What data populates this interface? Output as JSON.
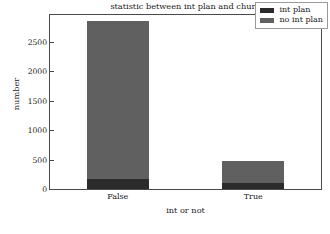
{
  "chart_data": {
    "type": "bar",
    "subtype": "stacked",
    "title": "statistic between int plan and churn",
    "xlabel": "int or not",
    "ylabel": "number",
    "categories": [
      "False",
      "True"
    ],
    "series": [
      {
        "name": "int plan",
        "color": "#2b2b2b",
        "values": [
          170,
          110
        ]
      },
      {
        "name": "no int plan",
        "color": "#606060",
        "values": [
          2680,
          373
        ]
      }
    ],
    "totals": [
      2850,
      483
    ],
    "ylim": [
      0,
      2950
    ],
    "yticks": [
      0,
      500,
      1000,
      1500,
      2000,
      2500
    ],
    "ytick_labels": [
      "0",
      "500",
      "1000",
      "1500",
      "2000",
      "2500"
    ],
    "grid": false,
    "legend_position": "upper right"
  },
  "legend": {
    "items": [
      {
        "label": "int plan",
        "color": "#2b2b2b"
      },
      {
        "label": "no int plan",
        "color": "#606060"
      }
    ]
  },
  "colors": {
    "int_plan": "#2b2b2b",
    "no_int_plan": "#606060",
    "axis": "#4a4a4a",
    "text": "#1a1a1a",
    "background": "#ffffff"
  }
}
